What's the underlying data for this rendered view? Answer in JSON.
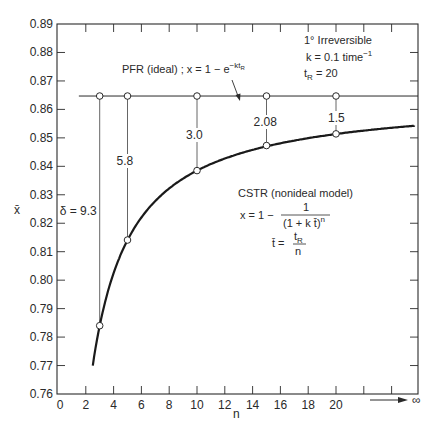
{
  "chart_data": {
    "type": "line",
    "title": "",
    "xlabel": "n",
    "ylabel": "x̄",
    "xlim": [
      0,
      26
    ],
    "ylim": [
      0.76,
      0.89
    ],
    "x_ticks": [
      0,
      2,
      4,
      6,
      8,
      10,
      12,
      14,
      16,
      18,
      20
    ],
    "x_tick_labels": [
      "0",
      "2",
      "4",
      "6",
      "8",
      "10",
      "12",
      "14",
      "16",
      "18",
      "20"
    ],
    "x_infinity_label": "∞",
    "y_ticks": [
      0.76,
      0.77,
      0.78,
      0.79,
      0.8,
      0.81,
      0.82,
      0.83,
      0.84,
      0.85,
      0.86,
      0.87,
      0.88,
      0.89
    ],
    "y_tick_labels": [
      "0.76",
      "0.77",
      "0.78",
      "0.79",
      "0.80",
      "0.81",
      "0.82",
      "0.83",
      "0.84",
      "0.85",
      "0.86",
      "0.87",
      "0.88",
      "0.89"
    ],
    "grid": false,
    "series": [
      {
        "name": "PFR (ideal)",
        "style": "thin line",
        "formula": "x = 1 − e^(−k tR)",
        "x": [
          1.5,
          26
        ],
        "values": [
          0.8647,
          0.8647
        ]
      },
      {
        "name": "CSTR (nonideal model)",
        "style": "thick curve",
        "formula": "x = 1 − 1/(1 + k t̄)^n, t̄ = tR/n",
        "x": [
          2.5,
          3,
          4,
          5,
          6,
          8,
          10,
          12,
          15,
          18,
          20,
          24,
          26
        ],
        "values": [
          0.7686,
          0.784,
          0.8025,
          0.8141,
          0.822,
          0.8323,
          0.8385,
          0.8427,
          0.8473,
          0.8498,
          0.8514,
          0.8536,
          0.8544
        ]
      }
    ],
    "markers": {
      "n": [
        3,
        5,
        10,
        15,
        20
      ],
      "pfr": [
        0.8647,
        0.8647,
        0.8647,
        0.8647,
        0.8647
      ],
      "cstr": [
        0.784,
        0.8141,
        0.8385,
        0.8473,
        0.8514
      ],
      "delta_labels": [
        "δ = 9.3",
        "5.8",
        "3.0",
        "2.08",
        "1.5"
      ]
    },
    "annotations": {
      "pfr_label": "PFR (ideal) ; x = 1 − e",
      "pfr_exponent": "−kt",
      "pfr_exponent_sub": "R",
      "conditions_line1": "1° Irreversible",
      "conditions_line2": "k = 0.1 time",
      "conditions_line2_sup": "−1",
      "conditions_line3_pre": "t",
      "conditions_line3_sub": "R",
      "conditions_line3_post": " = 20",
      "cstr_title": "CSTR (nonideal model)",
      "cstr_eq_lhs": "x = 1 −",
      "cstr_eq_num": "1",
      "cstr_eq_den": "(1 + k t̄)",
      "cstr_eq_den_sup": "n",
      "tbar_lhs": "t̄ =",
      "tbar_num": "t",
      "tbar_num_sub": "R",
      "tbar_den": "n"
    }
  }
}
